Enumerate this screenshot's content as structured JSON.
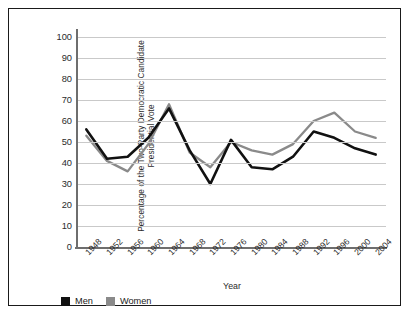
{
  "chart_data": {
    "type": "line",
    "title": "",
    "xlabel": "Year",
    "ylabel": "Percentage of the Two-Party Democratic Candidate Presidential Vote",
    "ylabel_line1": "Percentage of the Two-Party Democratic Candidate",
    "ylabel_line2": "Presidential Vote",
    "categories": [
      "1948",
      "1952",
      "1956",
      "1960",
      "1964",
      "1968",
      "1972",
      "1976",
      "1980",
      "1984",
      "1988",
      "1992",
      "1996",
      "2000",
      "2004"
    ],
    "ylim": [
      0,
      100
    ],
    "yticks": [
      0,
      10,
      20,
      30,
      40,
      50,
      60,
      70,
      80,
      90,
      100
    ],
    "grid": true,
    "legend_position": "below-left",
    "series": [
      {
        "name": "Men",
        "color": "#111111",
        "values": [
          56,
          42,
          43,
          52,
          66,
          46,
          30,
          51,
          38,
          37,
          43,
          55,
          52,
          47,
          44
        ]
      },
      {
        "name": "Women",
        "color": "#8a8a8a",
        "values": [
          53,
          41,
          36,
          49,
          68,
          45,
          38,
          50,
          46,
          44,
          49,
          60,
          64,
          55,
          52
        ]
      }
    ]
  },
  "legend": {
    "items": [
      {
        "label": "Men",
        "color": "#111111"
      },
      {
        "label": "Women",
        "color": "#8a8a8a"
      }
    ]
  },
  "colors": {
    "men": "#111111",
    "women": "#8a8a8a",
    "gridline": "#c9c9c9",
    "axis": "#6e6e6e",
    "border": "#1a1a1a",
    "text": "#2b2b2b",
    "background": "#ffffff"
  }
}
